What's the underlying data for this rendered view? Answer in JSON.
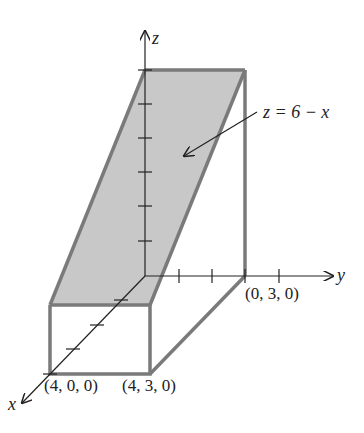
{
  "figure": {
    "colors": {
      "region_fill": "#c8c8c8",
      "region_edge": "#7a7a7a",
      "axis": "#222222"
    },
    "axes": {
      "x_label": "x",
      "y_label": "y",
      "z_label": "z"
    },
    "surface_label": "z = 6 − x",
    "points": [
      {
        "label": "(4, 0, 0)"
      },
      {
        "label": "(4, 3, 0)"
      },
      {
        "label": "(0, 3, 0)"
      }
    ],
    "ticks": {
      "x": 4,
      "y": 4,
      "z": 6
    }
  }
}
